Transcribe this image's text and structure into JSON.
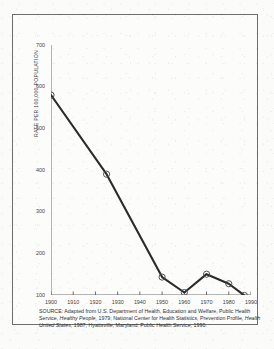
{
  "figure": {
    "border_color": "#6e6e70",
    "background": "#fcfcfb"
  },
  "chart_data": {
    "type": "line",
    "title": "",
    "subtitle": "",
    "xlabel": "",
    "ylabel": "RATE PER 100,000 POPULATION",
    "xlim": [
      1900,
      1990
    ],
    "ylim": [
      100,
      700
    ],
    "grid": false,
    "legend": null,
    "line_color": "#2b2b2d",
    "marker": "open-circle",
    "marker_color": "#4a4a4c",
    "x_ticks": [
      1900,
      1910,
      1920,
      1930,
      1940,
      1950,
      1960,
      1970,
      1980,
      1990
    ],
    "x_tick_labels": [
      "1900",
      "1910",
      "1920",
      "1930",
      "1940",
      "1950",
      "1960",
      "1970",
      "1980",
      "1990"
    ],
    "y_ticks": [
      100,
      200,
      300,
      400,
      500,
      600,
      700
    ],
    "y_tick_labels": [
      "100",
      "200",
      "300",
      "400",
      "500",
      "600",
      "700"
    ],
    "series": [
      {
        "name": "Rate per 100,000 population",
        "points": [
          {
            "x": 1900,
            "y": 580
          },
          {
            "x": 1925,
            "y": 390
          },
          {
            "x": 1950,
            "y": 143
          },
          {
            "x": 1960,
            "y": 106
          },
          {
            "x": 1970,
            "y": 150
          },
          {
            "x": 1980,
            "y": 127
          },
          {
            "x": 1987,
            "y": 99
          }
        ]
      }
    ]
  },
  "source_note": {
    "label": "SOURCE:",
    "line1_pre": " Adapted from U.S. Department of Health, Education and Welfare, Public Health",
    "line2_pre": "Service, ",
    "line2_ital": "Healthy People,",
    "line2_post": " 1979; National Center for Health Statistics, Prevention Profile,",
    "line3_ital": "Health United States,",
    "line3_post": " 1987; Hyattsville, Maryland: Public Health Service, 1990."
  }
}
